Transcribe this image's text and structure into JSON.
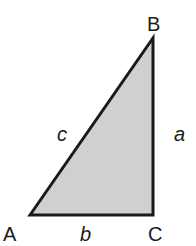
{
  "diagram": {
    "type": "right-triangle",
    "fill_color": "#d0d0d0",
    "stroke_color": "#1a1a1a",
    "vertices": [
      {
        "id": "A",
        "label": "A",
        "x": 30,
        "y": 215
      },
      {
        "id": "B",
        "label": "B",
        "x": 153,
        "y": 38
      },
      {
        "id": "C",
        "label": "C",
        "x": 153,
        "y": 215
      }
    ],
    "sides": [
      {
        "id": "a",
        "label": "a",
        "between": [
          "B",
          "C"
        ]
      },
      {
        "id": "b",
        "label": "b",
        "between": [
          "A",
          "C"
        ]
      },
      {
        "id": "c",
        "label": "c",
        "between": [
          "A",
          "B"
        ]
      }
    ],
    "right_angle_at": "C"
  }
}
